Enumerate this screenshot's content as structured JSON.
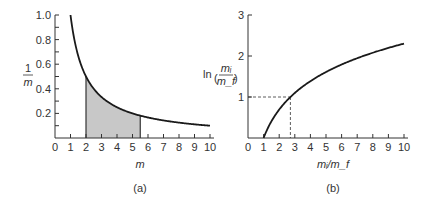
{
  "chart_data": [
    {
      "type": "line",
      "panel": "(a)",
      "title": "",
      "xlabel": "m",
      "ylabel": "1/m",
      "xlim": [
        0,
        10
      ],
      "ylim": [
        0,
        1.0
      ],
      "xticks": [
        "0",
        "1",
        "2",
        "3",
        "4",
        "5",
        "6",
        "7",
        "8",
        "9",
        "10"
      ],
      "yticks": [
        "0.2",
        "0.4",
        "0.6",
        "0.8",
        "1.0"
      ],
      "series": [
        {
          "name": "1/m",
          "x": [
            1,
            1.5,
            2,
            2.5,
            3,
            4,
            5,
            5.5,
            6,
            7,
            8,
            9,
            10
          ],
          "values": [
            1.0,
            0.667,
            0.5,
            0.4,
            0.333,
            0.25,
            0.2,
            0.182,
            0.167,
            0.143,
            0.125,
            0.111,
            0.1
          ]
        }
      ],
      "annotations": [
        "Shaded area under curve from m = 2 to m = 5.5"
      ],
      "grid": false
    },
    {
      "type": "line",
      "panel": "(b)",
      "title": "",
      "xlabel": "m_i/m_f",
      "ylabel": "ln(m_i/m_f)",
      "xlim": [
        0,
        10
      ],
      "ylim": [
        0,
        3
      ],
      "xticks": [
        "0",
        "1",
        "2",
        "3",
        "4",
        "5",
        "6",
        "7",
        "8",
        "9",
        "10"
      ],
      "yticks": [
        "1",
        "2",
        "3"
      ],
      "series": [
        {
          "name": "ln(m_i/m_f)",
          "x": [
            1,
            1.5,
            2,
            2.718,
            3,
            4,
            5,
            6,
            7,
            8,
            9,
            10
          ],
          "values": [
            0,
            0.405,
            0.693,
            1.0,
            1.099,
            1.386,
            1.609,
            1.792,
            1.946,
            2.079,
            2.197,
            2.303
          ]
        }
      ],
      "annotations": [
        "Dashed guide lines at y = 1 and x = e ≈ 2.72"
      ],
      "grid": false
    }
  ],
  "panels": {
    "a": {
      "label": "(a)",
      "xlabel": "m",
      "ylabel_num": "1",
      "ylabel_den": "m"
    },
    "b": {
      "label": "(b)",
      "xlabel": "mᵢ/m_f",
      "ylabel": "ln"
    }
  }
}
